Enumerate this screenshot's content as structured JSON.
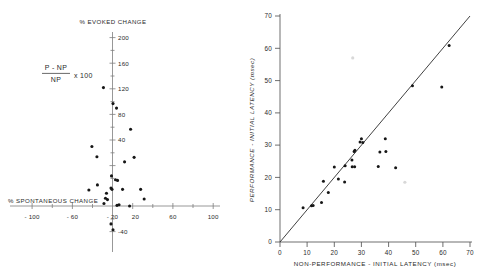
{
  "figure": {
    "title": "",
    "panels": [
      "left",
      "right"
    ]
  },
  "left_panel": {
    "y_axis_title": "% EVOKED CHANGE",
    "x_axis_title": "% SPONTANEOUS CHANGE",
    "formula": {
      "numerator": "P - NP",
      "denominator": "NP",
      "multiplier": "x 100"
    },
    "x_ticklabels": [
      "- 100",
      "- 60",
      "- 20",
      "20",
      "60",
      "100"
    ],
    "y_ticklabels": [
      "200",
      "160",
      "120",
      "80",
      "40",
      "-40"
    ]
  },
  "right_panel": {
    "x_axis_title": "NON-PERFORMANCE - INITIAL LATENCY (msec)",
    "y_axis_title": "PERFORMANCE - INITIAL LATENCY (msec)",
    "x_ticklabels": [
      "0",
      "10",
      "20",
      "30",
      "40",
      "50",
      "60",
      "70"
    ],
    "y_ticklabels": [
      "0",
      "10",
      "20",
      "30",
      "40",
      "50",
      "60",
      "70"
    ]
  },
  "chart_data": [
    {
      "type": "scatter",
      "id": "left-scatter",
      "title": "",
      "xlabel": "% SPONTANEOUS CHANGE",
      "ylabel": "% EVOKED CHANGE",
      "xlim": [
        -120,
        115
      ],
      "ylim": [
        -50,
        210
      ],
      "xticks": [
        -100,
        -60,
        -20,
        20,
        60,
        100
      ],
      "yticks": [
        200,
        160,
        120,
        80,
        40,
        -40
      ],
      "grid": false,
      "legend": null,
      "axes_style": "crossed-at-origin",
      "points": [
        {
          "x": -18,
          "y": 185
        },
        {
          "x": 1,
          "y": 160
        },
        {
          "x": 8,
          "y": 153
        },
        {
          "x": 36,
          "y": 120
        },
        {
          "x": -41,
          "y": 93
        },
        {
          "x": -31,
          "y": 77
        },
        {
          "x": 43,
          "y": 76
        },
        {
          "x": 24,
          "y": 69
        },
        {
          "x": -2,
          "y": 47
        },
        {
          "x": 6,
          "y": 41
        },
        {
          "x": 10,
          "y": 40
        },
        {
          "x": -30,
          "y": 33
        },
        {
          "x": -47,
          "y": 25
        },
        {
          "x": -3,
          "y": 28
        },
        {
          "x": -1,
          "y": 26
        },
        {
          "x": 20,
          "y": 26
        },
        {
          "x": 56,
          "y": 26
        },
        {
          "x": -12,
          "y": 20
        },
        {
          "x": -14,
          "y": 12
        },
        {
          "x": -10,
          "y": 10
        },
        {
          "x": 63,
          "y": 11
        },
        {
          "x": -17,
          "y": 4
        },
        {
          "x": 9,
          "y": 1
        },
        {
          "x": 13,
          "y": 2
        },
        {
          "x": 34,
          "y": 0
        },
        {
          "x": -3,
          "y": -28
        },
        {
          "x": 1,
          "y": -37
        }
      ]
    },
    {
      "type": "scatter",
      "id": "right-scatter",
      "title": "",
      "xlabel": "NON-PERFORMANCE - INITIAL LATENCY (msec)",
      "ylabel": "PERFORMANCE - INITIAL LATENCY (msec)",
      "xlim": [
        0,
        70
      ],
      "ylim": [
        0,
        70
      ],
      "xticks": [
        0,
        10,
        20,
        30,
        40,
        50,
        60,
        70
      ],
      "yticks": [
        0,
        10,
        20,
        30,
        40,
        50,
        60,
        70
      ],
      "grid": false,
      "legend": null,
      "reference_line": {
        "type": "identity",
        "from": [
          0,
          0
        ],
        "to": [
          70,
          70
        ]
      },
      "points": [
        {
          "x": 8.5,
          "y": 10.6
        },
        {
          "x": 11.6,
          "y": 11.2
        },
        {
          "x": 12.2,
          "y": 11.3
        },
        {
          "x": 15.3,
          "y": 12.2
        },
        {
          "x": 17.8,
          "y": 15.3
        },
        {
          "x": 16.0,
          "y": 18.8
        },
        {
          "x": 21.5,
          "y": 19.5
        },
        {
          "x": 23.8,
          "y": 18.6
        },
        {
          "x": 20.0,
          "y": 23.2
        },
        {
          "x": 24.0,
          "y": 23.6
        },
        {
          "x": 26.6,
          "y": 23.3
        },
        {
          "x": 27.5,
          "y": 23.3
        },
        {
          "x": 26.5,
          "y": 25.4
        },
        {
          "x": 27.3,
          "y": 28.0
        },
        {
          "x": 27.6,
          "y": 28.4
        },
        {
          "x": 29.5,
          "y": 31.0
        },
        {
          "x": 30.0,
          "y": 32.0
        },
        {
          "x": 30.5,
          "y": 30.8
        },
        {
          "x": 36.2,
          "y": 23.4
        },
        {
          "x": 42.6,
          "y": 23.0
        },
        {
          "x": 36.8,
          "y": 27.9
        },
        {
          "x": 39.0,
          "y": 28.0
        },
        {
          "x": 38.8,
          "y": 32.0
        },
        {
          "x": 48.8,
          "y": 48.4
        },
        {
          "x": 59.6,
          "y": 48.0
        },
        {
          "x": 62.3,
          "y": 60.9
        }
      ],
      "faint_marks": [
        {
          "x": 26.8,
          "y": 57.0
        },
        {
          "x": 46.0,
          "y": 18.5
        }
      ]
    }
  ]
}
